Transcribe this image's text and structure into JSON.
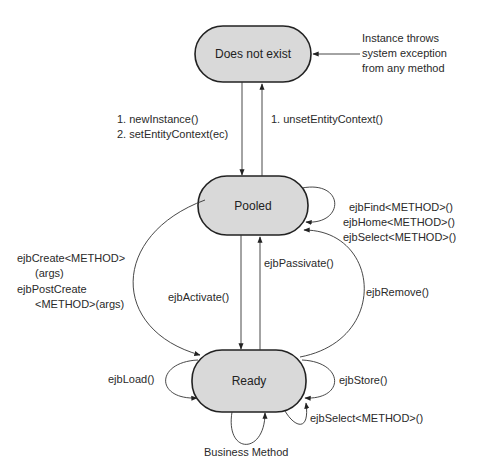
{
  "diagram": {
    "colors": {
      "state_fill": "#d9d9d9",
      "stroke": "#222222",
      "background": "#ffffff"
    },
    "states": {
      "does_not_exist": "Does not exist",
      "pooled": "Pooled",
      "ready": "Ready"
    },
    "labels": {
      "exception": [
        "Instance throws",
        "system exception",
        "from any method"
      ],
      "create_instance": [
        "1. newInstance()",
        "2. setEntityContext(ec)"
      ],
      "unset_context": "1. unsetEntityContext()",
      "pooled_self": [
        "ejbFind<METHOD>()",
        "ejbHome<METHOD>()",
        "ejbSelect<METHOD>()"
      ],
      "ejb_create": [
        "ejbCreate<METHOD>",
        "(args)",
        "ejbPostCreate",
        "<METHOD>(args)"
      ],
      "ejb_activate": "ejbActivate()",
      "ejb_passivate": "ejbPassivate()",
      "ejb_remove": "ejbRemove()",
      "ejb_load": "ejbLoad()",
      "ejb_store": "ejbStore()",
      "ready_select": "ejbSelect<METHOD>()",
      "business_method": "Business Method"
    }
  }
}
